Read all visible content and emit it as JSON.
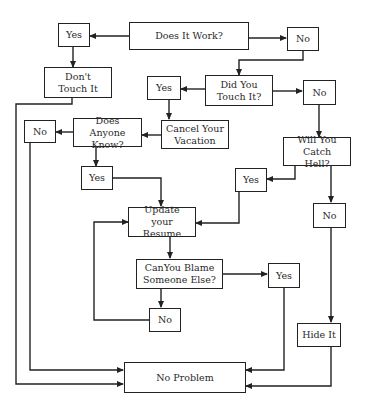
{
  "diagram": {
    "type": "flowchart",
    "nodes": {
      "works": "Does It Work?",
      "yes1": "Yes",
      "no1": "No",
      "dont_touch": "Don't Touch It",
      "touched": "Did You Touch It?",
      "yes2": "Yes",
      "no2": "No",
      "anyone_know": "Does Anyone Know?",
      "no3": "No",
      "cancel_vacation": "Cancel Your Vacation",
      "catch_hell": "Will You Catch Hell?",
      "yes3": "Yes",
      "yes4": "Yes",
      "no4": "No",
      "update_resume": "Update your Resume",
      "blame": "CanYou Blame Someone Else?",
      "yes5": "Yes",
      "no5": "No",
      "hide_it": "Hide It",
      "no_problem": "No Problem"
    },
    "edges": [
      [
        "works",
        "yes1"
      ],
      [
        "works",
        "no1"
      ],
      [
        "yes1",
        "dont_touch"
      ],
      [
        "dont_touch",
        "no_problem"
      ],
      [
        "no1",
        "touched"
      ],
      [
        "touched",
        "yes2"
      ],
      [
        "touched",
        "no2"
      ],
      [
        "yes2",
        "cancel_vacation"
      ],
      [
        "cancel_vacation",
        "anyone_know"
      ],
      [
        "anyone_know",
        "no3"
      ],
      [
        "anyone_know",
        "yes3"
      ],
      [
        "no3",
        "no_problem"
      ],
      [
        "yes3",
        "update_resume"
      ],
      [
        "no2",
        "catch_hell"
      ],
      [
        "catch_hell",
        "yes4"
      ],
      [
        "catch_hell",
        "no4"
      ],
      [
        "yes4",
        "update_resume"
      ],
      [
        "update_resume",
        "blame"
      ],
      [
        "blame",
        "yes5"
      ],
      [
        "blame",
        "no5"
      ],
      [
        "no5",
        "update_resume"
      ],
      [
        "yes5",
        "no_problem"
      ],
      [
        "no4",
        "hide_it"
      ],
      [
        "hide_it",
        "no_problem"
      ]
    ]
  }
}
